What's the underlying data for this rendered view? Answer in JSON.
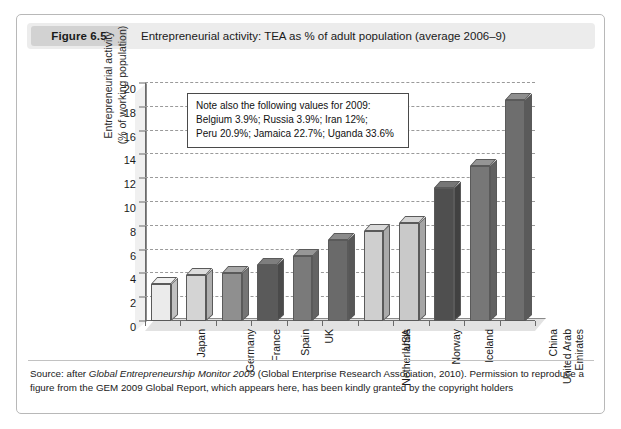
{
  "figure": {
    "tag": "Figure 6.5",
    "caption": "Entrepreneurial activity: TEA as % of adult population (average 2006–9)"
  },
  "note": {
    "line1": "Note also the following values for 2009:",
    "line2": "Belgium 3.9%; Russia 3.9%; Iran 12%;",
    "line3": "Peru 20.9%; Jamaica 22.7%; Uganda 33.6%"
  },
  "source": {
    "prefix": "Source: after ",
    "italic": "Global Entrepreneurship Monitor 2009",
    "suffix": " (Global Enterprise Research Association, 2010). Permission to reproduce a figure from the GEM 2009 Global Report, which appears here, has been kindly granted by the copyright holders"
  },
  "chart_data": {
    "type": "bar",
    "title": "Entrepreneurial activity: TEA as % of adult population (average 2006–9)",
    "xlabel": "",
    "ylabel": "Entrepreneurial activity (% of working population)",
    "ylabel_line1": "Entrepreneurial activity",
    "ylabel_line2": "(% of working population)",
    "ylim": [
      0,
      20
    ],
    "ytick_step": 2,
    "yticks": [
      0,
      2,
      4,
      6,
      8,
      10,
      12,
      14,
      16,
      18,
      20
    ],
    "grid": true,
    "legend": "none",
    "categories": [
      "Japan",
      "Germany",
      "France",
      "Spain",
      "UK",
      "Netherlands",
      "USA",
      "Norway",
      "Iceland",
      "United Arab Emirates",
      "China"
    ],
    "values": [
      3.1,
      3.9,
      4.0,
      4.7,
      5.5,
      6.8,
      7.6,
      8.2,
      11.2,
      13.0,
      18.6
    ],
    "bar_colors": [
      "#ebebeb",
      "#d4d4d4",
      "#8f8f8f",
      "#5a5a5a",
      "#7a7a7a",
      "#6a6a6a",
      "#cfcfcf",
      "#c9c9c9",
      "#4f4f4f",
      "#777777",
      "#6e6e6e"
    ],
    "annotations": [
      "Note also the following values for 2009:",
      "Belgium 3.9%; Russia 3.9%; Iran 12%;",
      "Peru 20.9%; Jamaica 22.7%; Uganda 33.6%"
    ]
  }
}
